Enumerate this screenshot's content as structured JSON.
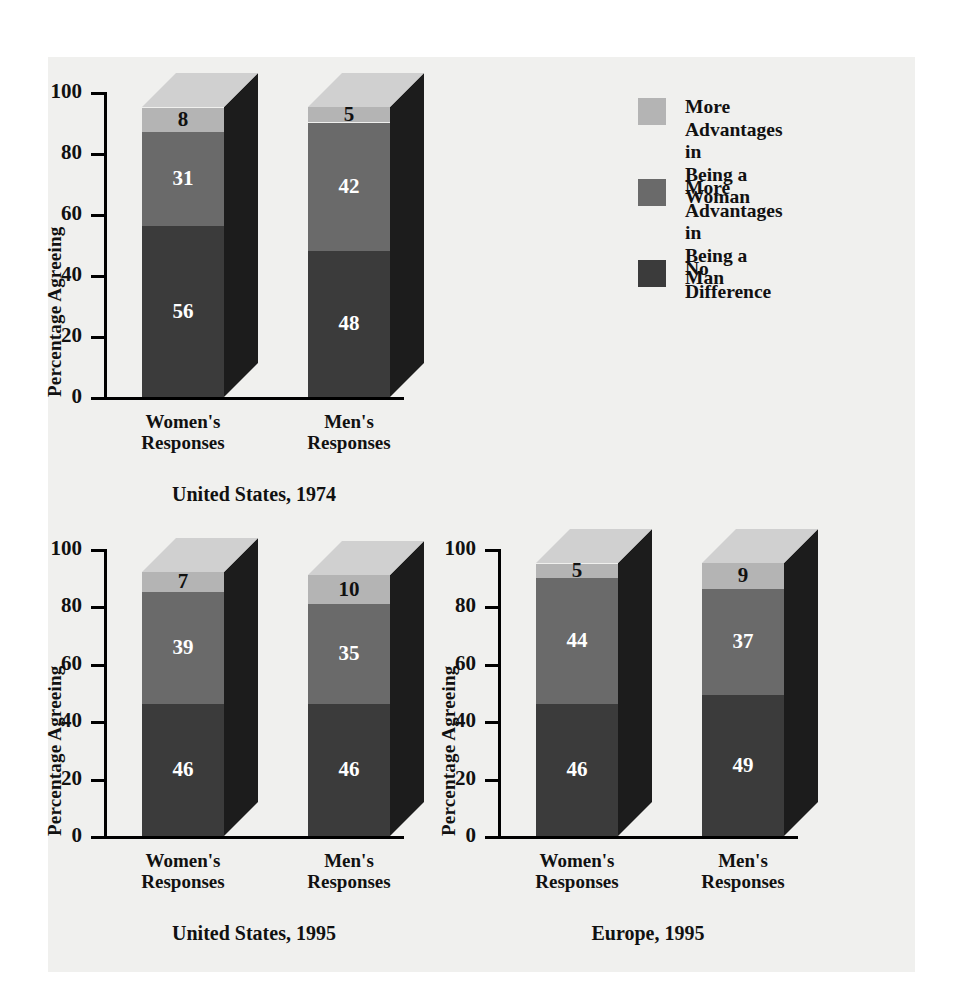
{
  "colors": {
    "background": "#ffffff",
    "panel": "#f0f0ee",
    "woman_segment": "#b4b4b4",
    "man_segment": "#6a6a6a",
    "nodiff_segment": "#3b3b3b",
    "side_face": "#1c1c1c",
    "top_face_light": "#d0d0d0",
    "axis": "#000000",
    "label_dark": "#111111",
    "label_light": "#ffffff"
  },
  "legend": {
    "items": [
      {
        "label": "More Advantages in\nBeing a Woman",
        "color_key": "woman_segment",
        "swatch": "#b4b4b4"
      },
      {
        "label": "More Advantages in\nBeing a Man",
        "color_key": "man_segment",
        "swatch": "#6a6a6a"
      },
      {
        "label": "No Difference",
        "color_key": "nodiff_segment",
        "swatch": "#3b3b3b"
      }
    ]
  },
  "axis": {
    "ylabel": "Percentage Agreeing",
    "ticks": [
      "100",
      "80",
      "60",
      "40",
      "20",
      "0"
    ],
    "ylim": [
      0,
      100
    ]
  },
  "charts": [
    {
      "id": "us-1974",
      "title": "United States, 1974",
      "categories": [
        "Women's\nResponses",
        "Men's\nResponses"
      ],
      "bars": [
        {
          "category": "Women's Responses",
          "no_difference": 56,
          "more_adv_man": 31,
          "more_adv_woman": 8
        },
        {
          "category": "Men's Responses",
          "no_difference": 48,
          "more_adv_man": 42,
          "more_adv_woman": 5
        }
      ]
    },
    {
      "id": "us-1995",
      "title": "United States, 1995",
      "categories": [
        "Women's\nResponses",
        "Men's\nResponses"
      ],
      "bars": [
        {
          "category": "Women's Responses",
          "no_difference": 46,
          "more_adv_man": 39,
          "more_adv_woman": 7
        },
        {
          "category": "Men's Responses",
          "no_difference": 46,
          "more_adv_man": 35,
          "more_adv_woman": 10
        }
      ]
    },
    {
      "id": "europe-1995",
      "title": "Europe, 1995",
      "categories": [
        "Women's\nResponses",
        "Men's\nResponses"
      ],
      "bars": [
        {
          "category": "Women's Responses",
          "no_difference": 46,
          "more_adv_man": 44,
          "more_adv_woman": 5
        },
        {
          "category": "Men's Responses",
          "no_difference": 49,
          "more_adv_man": 37,
          "more_adv_woman": 9
        }
      ]
    }
  ],
  "chart_data": {
    "type": "bar",
    "subtype": "stacked-3d",
    "title": "",
    "ylabel": "Percentage Agreeing",
    "xlabel": "",
    "ylim": [
      0,
      100
    ],
    "yticks": [
      0,
      20,
      40,
      60,
      80,
      100
    ],
    "grid": false,
    "legend_position": "top-right",
    "series": [
      {
        "name": "No Difference",
        "color": "#3b3b3b"
      },
      {
        "name": "More Advantages in Being a Man",
        "color": "#6a6a6a"
      },
      {
        "name": "More Advantages in Being a Woman",
        "color": "#b4b4b4"
      }
    ],
    "panels": [
      {
        "title": "United States, 1974",
        "categories": [
          "Women's Responses",
          "Men's Responses"
        ],
        "values": {
          "No Difference": [
            56,
            48
          ],
          "More Advantages in Being a Man": [
            31,
            42
          ],
          "More Advantages in Being a Woman": [
            8,
            5
          ]
        }
      },
      {
        "title": "United States, 1995",
        "categories": [
          "Women's Responses",
          "Men's Responses"
        ],
        "values": {
          "No Difference": [
            46,
            46
          ],
          "More Advantages in Being a Man": [
            39,
            35
          ],
          "More Advantages in Being a Woman": [
            7,
            10
          ]
        }
      },
      {
        "title": "Europe, 1995",
        "categories": [
          "Women's Responses",
          "Men's Responses"
        ],
        "values": {
          "No Difference": [
            46,
            49
          ],
          "More Advantages in Being a Man": [
            44,
            37
          ],
          "More Advantages in Being a Woman": [
            5,
            9
          ]
        }
      }
    ]
  }
}
